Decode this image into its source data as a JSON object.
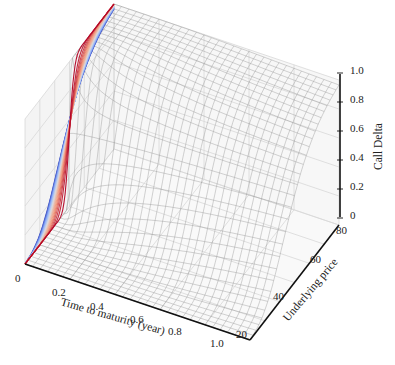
{
  "chart_data": {
    "type": "surface3d",
    "title": "",
    "xlabel": "Time to maturity (year)",
    "ylabel": "Underlying price",
    "zlabel": "Call Delta",
    "x_ticks": [
      "0",
      "0.2",
      "0.4",
      "0.6",
      "0.8",
      "1.0"
    ],
    "y_ticks": [
      "20",
      "40",
      "60",
      "80"
    ],
    "z_ticks": [
      "0",
      "0.2",
      "0.4",
      "0.6",
      "0.8",
      "1.0"
    ],
    "xlim": [
      0,
      1.0
    ],
    "ylim": [
      20,
      80
    ],
    "zlim": [
      0,
      1.0
    ],
    "surface": {
      "description": "Black-Scholes call delta as a function of time to maturity and underlying price; grey wireframe mesh",
      "strike_approx": 50,
      "mesh_color": "#9a9a9a"
    },
    "contour_projection": {
      "description": "Curves at t=0 plane colored from blue (short maturity, steep) to red (long maturity, flat)",
      "colormap": [
        "#3b4cc0",
        "#8db0fe",
        "#dddcdc",
        "#f4987a",
        "#b40426"
      ]
    },
    "grid": true
  }
}
